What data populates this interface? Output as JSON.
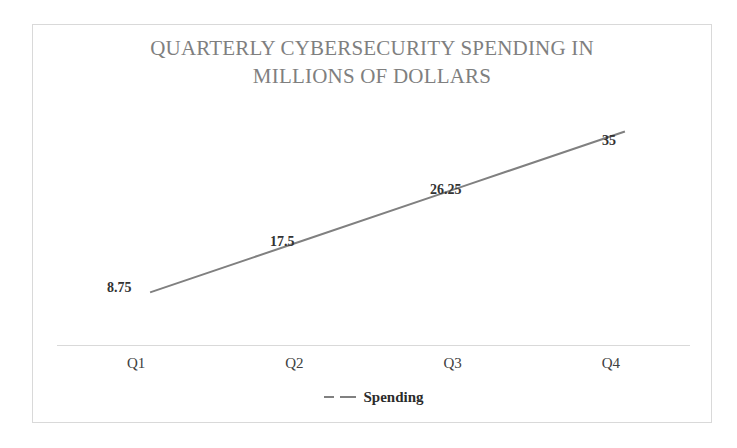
{
  "chart_data": {
    "type": "line",
    "title": "QUARTERLY CYBERSECURITY SPENDING IN\nMILLIONS OF DOLLARS",
    "xlabel": "",
    "ylabel": "",
    "categories": [
      "Q1",
      "Q2",
      "Q3",
      "Q4"
    ],
    "series": [
      {
        "name": "Spending",
        "values": [
          8.75,
          17.5,
          26.25,
          35
        ],
        "value_labels": [
          "8.75",
          "17.5",
          "26.25",
          "35"
        ],
        "color": "#808080",
        "line_style": "solid",
        "line_width": 2,
        "markers": "none"
      }
    ],
    "data_labels_shown": true,
    "ylim": [
      0,
      38.5
    ],
    "grid": false,
    "y_axis_visible": false,
    "x_axis_line_color": "#d9d9d9",
    "legend": {
      "position": "bottom",
      "entries": [
        {
          "label": "Spending",
          "marker": "dashed-line",
          "color": "#808080"
        }
      ]
    },
    "title_color": "#7f7f7f",
    "label_color": "#333333",
    "tick_color": "#404040",
    "plot_background": "#ffffff",
    "border_color": "#d9d9d9"
  }
}
